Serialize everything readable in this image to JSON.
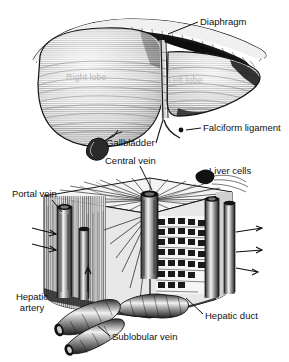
{
  "figure": {
    "style": "black-and-white engraving / halftone scan",
    "background_color": "#ffffff",
    "ink_color": "#111111",
    "faint_label_color": "#b9b9b9"
  },
  "panels": [
    {
      "name": "gross-anatomy",
      "description": "Anterior view of the whole liver showing right and left lobes beneath the diaphragm, with gallbladder and falciform ligament."
    },
    {
      "name": "hepatic-lobule",
      "description": "Cut-away three-dimensional block of a liver lobule showing central vein, radiating cords of liver cells, portal vein, hepatic artery, hepatic duct and sublobular vein."
    }
  ],
  "labels": {
    "diaphragm": "Diaphragm",
    "falciform_ligament": "Falciform ligament",
    "gallbladder": "Gallbladder",
    "central_vein": "Central vein",
    "liver_cells": "Liver cells",
    "portal_vein": "Portal vein",
    "hepatic_artery_line1": "Hepatic",
    "hepatic_artery_line2": "artery",
    "hepatic_duct": "Hepatic duct",
    "sublobular_vein": "Sublobular vein"
  },
  "embedded_labels": {
    "right_lobe": "Right lobe",
    "left_lobe": "Left lobe"
  }
}
